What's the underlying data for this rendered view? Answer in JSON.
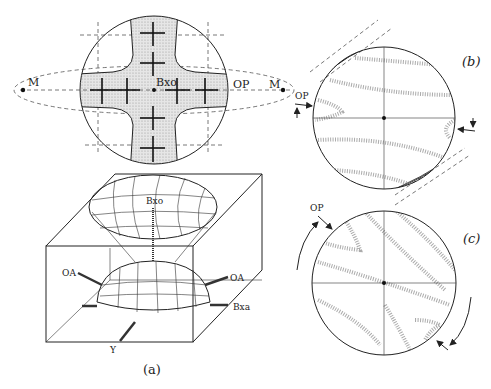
{
  "figure": {
    "panel_a": {
      "caption": "(a)",
      "conoscope_labels": {
        "bxo": "Bxo",
        "op": "OP",
        "m_left": "M",
        "m_right": "M"
      },
      "indicatrix_labels": {
        "bxo": "Bxo",
        "oa_left": "OA",
        "oa_right": "OA",
        "bxa": "Bxa",
        "y": "Y"
      }
    },
    "panel_b": {
      "caption": "(b)",
      "op_label": "OP"
    },
    "panel_c": {
      "caption": "(c)",
      "op_label": "OP"
    }
  },
  "colors": {
    "ink": "#222222",
    "shading": "#d9d9d9",
    "background": "#ffffff"
  }
}
